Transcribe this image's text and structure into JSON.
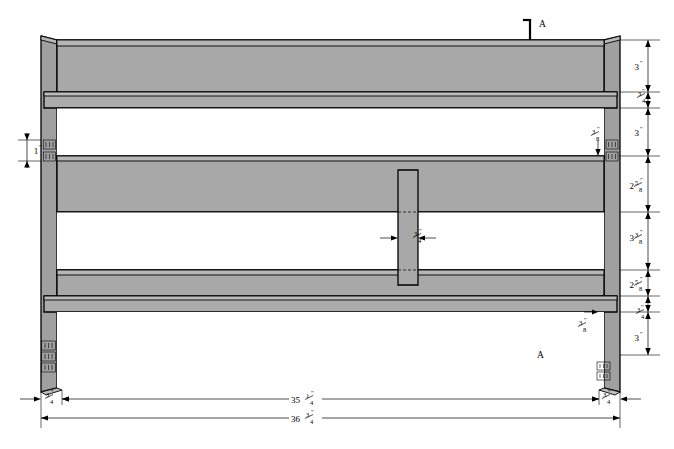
{
  "drawing": {
    "title": "Headboard Front Elevation",
    "type": "technical-line-drawing",
    "background_color": "#ffffff",
    "fill_color": "#a8a8a8",
    "fill_color_light": "#b4b4b4",
    "fill_color_dark": "#9a9a9a",
    "line_color": "#000000",
    "units": "inches"
  },
  "section_marks": {
    "top_label": "A",
    "bottom_label": "A"
  },
  "dimensions_right": [
    {
      "id": "r1",
      "value": "3",
      "unit": "\"",
      "whole": "3",
      "num": "",
      "den": ""
    },
    {
      "id": "r2",
      "value": "3/4",
      "unit": "\"",
      "whole": "",
      "num": "3",
      "den": "4"
    },
    {
      "id": "r3",
      "value": "3",
      "unit": "\"",
      "whole": "3",
      "num": "",
      "den": ""
    },
    {
      "id": "r4",
      "value": "2 5/8",
      "unit": "\"",
      "whole": "2",
      "num": "5",
      "den": "8"
    },
    {
      "id": "r5",
      "value": "3 3/8",
      "unit": "\"",
      "whole": "3",
      "num": "3",
      "den": "8"
    },
    {
      "id": "r6",
      "value": "2 5/8",
      "unit": "\"",
      "whole": "2",
      "num": "5",
      "den": "8"
    },
    {
      "id": "r7",
      "value": "3/4",
      "unit": "\"",
      "whole": "",
      "num": "3",
      "den": "4"
    },
    {
      "id": "r8",
      "value": "3",
      "unit": "\"",
      "whole": "3",
      "num": "",
      "den": ""
    }
  ],
  "dimensions_inner_right": [
    {
      "id": "ir1",
      "value": "3/8",
      "unit": "\"",
      "whole": "",
      "num": "3",
      "den": "8"
    },
    {
      "id": "ir2",
      "value": "3/8",
      "unit": "\"",
      "whole": "",
      "num": "3",
      "den": "8"
    }
  ],
  "dimensions_left": [
    {
      "id": "l1",
      "value": "1",
      "unit": "\"",
      "whole": "1",
      "num": "",
      "den": ""
    }
  ],
  "dimensions_center": [
    {
      "id": "c1",
      "value": "3/4",
      "unit": "\"",
      "whole": "",
      "num": "3",
      "den": "4"
    }
  ],
  "dimensions_bottom": [
    {
      "id": "b1",
      "value": "3/4",
      "unit": "\"",
      "whole": "",
      "num": "3",
      "den": "4",
      "position": "left"
    },
    {
      "id": "b2",
      "value": "35 1/4",
      "unit": "\"",
      "whole": "35",
      "num": "1",
      "den": "4",
      "position": "center-upper"
    },
    {
      "id": "b3",
      "value": "36 3/4",
      "unit": "\"",
      "whole": "36",
      "num": "3",
      "den": "4",
      "position": "center-lower"
    },
    {
      "id": "b4",
      "value": "3/4",
      "unit": "\"",
      "whole": "",
      "num": "3",
      "den": "4",
      "position": "right"
    }
  ]
}
